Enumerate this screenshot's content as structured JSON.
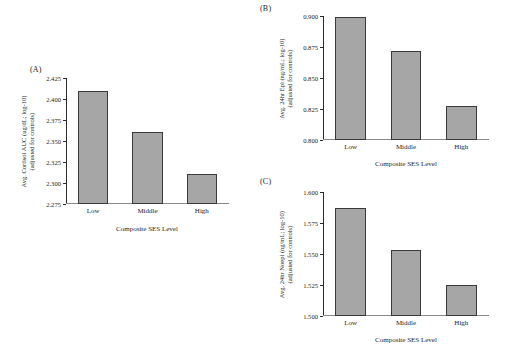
{
  "figure": {
    "background": "#ffffff",
    "bar_fill": "#a6a6a6",
    "bar_stroke": "#3a3a3a",
    "axis_color": "#2a2a2a"
  },
  "panels": [
    {
      "letter": "(A)",
      "ylabel_line1": "Avg. Cortisol AUC (ug/dL; log-10)",
      "ylabel_line2": "(adjusted for controls)"
    },
    {
      "letter": "(B)",
      "ylabel_line1": "Avg. 24hr Epi (ng/mL; log-10)",
      "ylabel_line2": "(adjusted for controls)"
    },
    {
      "letter": "(C)",
      "ylabel_line1": "Avg. 24hr Noepi (ng/mL; log-10)",
      "ylabel_line2": "(adjusted for controls)"
    }
  ],
  "chart_data": [
    {
      "panel": "A",
      "type": "bar",
      "title": "",
      "xlabel": "Composite SES Level",
      "ylabel": "Avg. Cortisol AUC (ug/dL; log-10) (adjusted for controls)",
      "categories": [
        "Low",
        "Middle",
        "High"
      ],
      "values": [
        2.41,
        2.361,
        2.311
      ],
      "ylim": [
        2.275,
        2.425
      ],
      "yticks": [
        2.275,
        2.3,
        2.325,
        2.35,
        2.375,
        2.4,
        2.425
      ],
      "ytick_labels": [
        "2.275",
        "2.300",
        "2.325",
        "2.350",
        "2.375",
        "2.400",
        "2.425"
      ],
      "grid": false,
      "legend": "none"
    },
    {
      "panel": "B",
      "type": "bar",
      "title": "",
      "xlabel": "Composite SES Level",
      "ylabel": "Avg. 24hr Epi (ng/mL; log-10) (adjusted for controls)",
      "categories": [
        "Low",
        "Middle",
        "High"
      ],
      "values": [
        0.8995,
        0.8715,
        0.8275
      ],
      "ylim": [
        0.8,
        0.9
      ],
      "yticks": [
        0.8,
        0.825,
        0.85,
        0.875,
        0.9
      ],
      "ytick_labels": [
        "0.800",
        "0.825",
        "0.850",
        "0.875",
        "0.900"
      ],
      "grid": false,
      "legend": "none"
    },
    {
      "panel": "C",
      "type": "bar",
      "title": "",
      "xlabel": "Composite SES Level",
      "ylabel": "Avg. 24hr Noepi (ng/mL; log-10) (adjusted for controls)",
      "categories": [
        "Low",
        "Middle",
        "High"
      ],
      "values": [
        1.587,
        1.553,
        1.525
      ],
      "ylim": [
        1.5,
        1.6
      ],
      "yticks": [
        1.5,
        1.525,
        1.55,
        1.575,
        1.6
      ],
      "ytick_labels": [
        "1.500",
        "1.525",
        "1.550",
        "1.575",
        "1.600"
      ],
      "grid": false,
      "legend": "none"
    }
  ]
}
